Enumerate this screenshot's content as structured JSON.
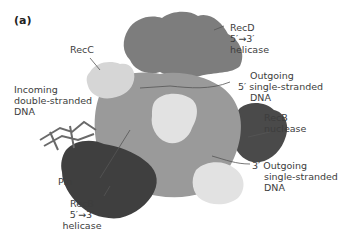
{
  "figure": {
    "panel_label": "(a)",
    "colors": {
      "recd": "#7d7d7d",
      "recc": "#d6d6d6",
      "recb_helicase": "#3f3f3f",
      "recb_nuclease": "#4a4a4a",
      "core": "#9a9a9a",
      "light_blob": "#e2e2e2",
      "leader_line": "#555555"
    },
    "labels": {
      "recc": "RecC",
      "recd_1": "RecD",
      "recd_2": "5′→3′",
      "recd_3": "helicase",
      "incoming_1": "Incoming",
      "incoming_2": "double-stranded",
      "incoming_3": "DNA",
      "out5_1": "Outgoing",
      "out5_2": "5′ single-stranded",
      "out5_3": "DNA",
      "recb_nuc_1": "RecB",
      "recb_nuc_2": "nuclease",
      "out3_1": "3′ Outgoing",
      "out3_2": "single-stranded",
      "out3_3": "DNA",
      "pin": "Pin",
      "recb_hel_1": "RecB",
      "recb_hel_2": "5′→3′",
      "recb_hel_3": "helicase"
    }
  }
}
